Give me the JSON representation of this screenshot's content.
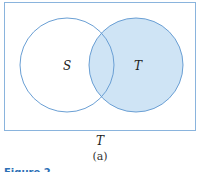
{
  "diagram": {
    "type": "venn",
    "universe_label": "T",
    "subfigure_label": "(a)",
    "figure_caption": "Figure 2",
    "sets": [
      {
        "name": "S",
        "shaded": false
      },
      {
        "name": "T",
        "shaded": true
      }
    ],
    "colors": {
      "outline": "#6a9fd4",
      "fill": "#cfe4f5",
      "border": "#8ab4dd"
    }
  }
}
